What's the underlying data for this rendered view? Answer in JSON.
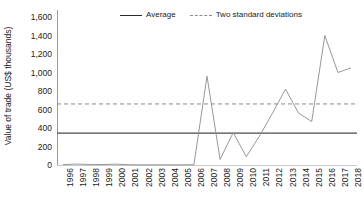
{
  "chart_data": {
    "type": "line",
    "title": "",
    "xlabel": "",
    "ylabel": "Value of trade (US$ thousands)",
    "ylim": [
      0,
      1600
    ],
    "ytick_labels": [
      "1,600",
      "1,400",
      "1,200",
      "1,000",
      "800",
      "600",
      "400",
      "200",
      "0"
    ],
    "ytick_values": [
      1600,
      1400,
      1200,
      1000,
      800,
      600,
      400,
      200,
      0
    ],
    "grid": false,
    "legend_position": "top-center",
    "legend": [
      {
        "label": "Average",
        "style": "solid"
      },
      {
        "label": "Two standard deviations",
        "style": "dashed"
      }
    ],
    "categories": [
      "1996",
      "1997",
      "1998",
      "1999",
      "2000",
      "2001",
      "2002",
      "2003",
      "2004",
      "2005",
      "2006",
      "2007",
      "2008",
      "2009",
      "2010",
      "2011",
      "2012",
      "2013",
      "2014",
      "2015",
      "2016",
      "2017",
      "2018"
    ],
    "series": [
      {
        "name": "Value of trade",
        "style": "solid",
        "color": "#8c8c8c",
        "values": [
          4,
          10,
          6,
          5,
          9,
          3,
          2,
          2,
          2,
          2,
          3,
          960,
          60,
          350,
          90,
          310,
          560,
          820,
          560,
          470,
          1400,
          1000,
          1050
        ]
      }
    ],
    "reference_lines": [
      {
        "name": "Average",
        "value": 345,
        "style": "solid",
        "color": "#4a4a4a"
      },
      {
        "name": "Two standard deviations",
        "value": 660,
        "style": "dashed",
        "color": "#8c8c8c"
      }
    ]
  }
}
